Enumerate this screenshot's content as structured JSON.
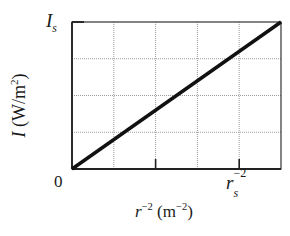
{
  "chart_data": {
    "type": "line",
    "title": "",
    "xlabel": "r^-2 (m^-2)",
    "ylabel": "I (W/m^2)",
    "x_tick_labels": [
      {
        "pos": 0,
        "label": "0"
      },
      {
        "pos": 4,
        "label": "r_s^-2"
      }
    ],
    "y_tick_labels": [
      {
        "pos": 4,
        "label": "I_s"
      }
    ],
    "xlim": [
      0,
      5
    ],
    "ylim": [
      0,
      4
    ],
    "grid": true,
    "grid_x_divisions": 5,
    "grid_y_divisions": 4,
    "legend": null,
    "series": [
      {
        "name": "I vs r^-2",
        "x": [
          0,
          5
        ],
        "y": [
          0,
          4
        ],
        "color": "#111111",
        "linewidth": 3.5
      }
    ]
  },
  "labels": {
    "ylabel_main": "I",
    "ylabel_unit_open": " (W/m",
    "ylabel_exp": "2",
    "ylabel_close": ")",
    "ymax_main": "I",
    "ymax_sub": "s",
    "origin": "0",
    "xtick_main": "r",
    "xtick_sup": "−2",
    "xtick_sub": "s",
    "xlabel_main": "r",
    "xlabel_exp": "−2",
    "xlabel_unit_open": " (m",
    "xlabel_unit_exp": "−2",
    "xlabel_close": ")"
  },
  "colors": {
    "frame": "#333333",
    "grid": "#9a9a9a",
    "line": "#111111"
  }
}
